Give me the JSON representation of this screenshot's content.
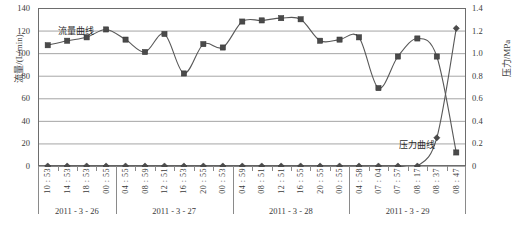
{
  "chart_data": {
    "type": "line",
    "title": "",
    "xlabel": "",
    "ylabel": "流量/(L/min)",
    "ylabel_right": "压力/MPa",
    "ylim": [
      0,
      140
    ],
    "ylim_right": [
      0,
      1.4
    ],
    "yticks": [
      0,
      20,
      40,
      60,
      80,
      100,
      120,
      140
    ],
    "yticks_right": [
      "0",
      "0.2",
      "0.4",
      "0.6",
      "0.8",
      "1.0",
      "1.2",
      "1.4"
    ],
    "grid": true,
    "legend_position": "inline-annotation",
    "x": [
      "10 : 53",
      "14 : 53",
      "18 : 53",
      "00 : 55",
      "04 : 55",
      "08 : 59",
      "12 : 51",
      "16 : 53",
      "20 : 55",
      "00 : 53",
      "04 : 59",
      "08 : 51",
      "12 : 51",
      "16 : 55",
      "20 : 55",
      "00 : 55",
      "04 : 58",
      "07 : 04",
      "07 : 57",
      "08 : 17",
      "08 : 37",
      "08 : 47"
    ],
    "date_groups": [
      {
        "label": "2011 - 3 - 26",
        "count": 4
      },
      {
        "label": "2011 - 3 - 27",
        "count": 6
      },
      {
        "label": "2011 - 3 - 28",
        "count": 6
      },
      {
        "label": "2011 - 3 - 29",
        "count": 6
      }
    ],
    "series": [
      {
        "name": "流量曲线",
        "axis": "left",
        "marker": "square",
        "color": "#585858",
        "values": [
          107,
          111,
          114,
          121,
          112,
          101,
          117,
          82,
          108,
          105,
          128,
          129,
          131,
          130,
          111,
          112,
          114,
          69,
          97,
          113,
          97,
          12
        ]
      },
      {
        "name": "压力曲线",
        "axis": "right",
        "marker": "diamond",
        "color": "#585858",
        "values": [
          0,
          0,
          0,
          0,
          0,
          0,
          0,
          0,
          0,
          0,
          0,
          0,
          0,
          0,
          0,
          0,
          0,
          0,
          0,
          0,
          0.25,
          1.22
        ]
      }
    ],
    "annotations": [
      {
        "text": "流量曲线",
        "name": "flow-curve-label"
      },
      {
        "text": "压力曲线",
        "name": "pressure-curve-label"
      }
    ]
  },
  "caption": ""
}
